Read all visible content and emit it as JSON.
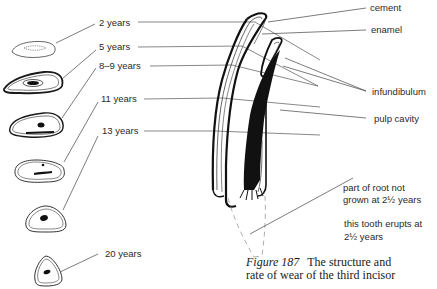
{
  "figure": {
    "number": "Figure 187",
    "caption": "The structure and rate of wear of the third incisor",
    "caption_line1": "The structure and",
    "caption_line2": "rate of wear of the third incisor"
  },
  "age_labels": [
    {
      "id": "age-2",
      "text": "2 years"
    },
    {
      "id": "age-5",
      "text": "5 years"
    },
    {
      "id": "age-8-9",
      "text": "8–9 years"
    },
    {
      "id": "age-11",
      "text": "11 years"
    },
    {
      "id": "age-13",
      "text": "13 years"
    },
    {
      "id": "age-20",
      "text": "20 years"
    }
  ],
  "structure_labels": [
    {
      "id": "cement",
      "text": "cement"
    },
    {
      "id": "enamel",
      "text": "enamel"
    },
    {
      "id": "infundibulum",
      "text": "infundibulum"
    },
    {
      "id": "pulp-cavity",
      "text": "pulp cavity"
    }
  ],
  "notes": {
    "root_line1": "part of root not",
    "root_line2": "grown at 2½ years",
    "erupt_line1": "this tooth erupts at",
    "erupt_line2": "2½ years"
  },
  "colors": {
    "ink": "#1a1a1a",
    "leader": "#444444",
    "dashed": "#999999"
  }
}
